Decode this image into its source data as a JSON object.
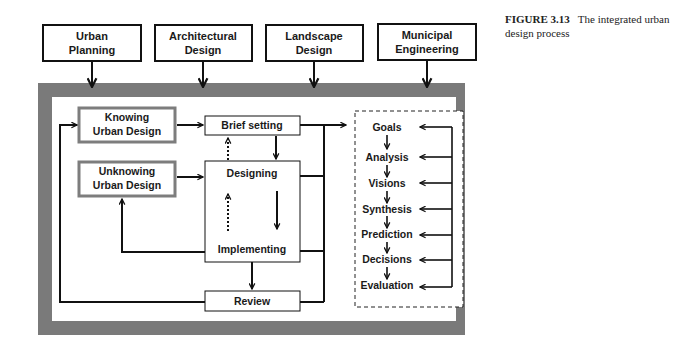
{
  "caption": {
    "figure_label": "FIGURE 3.13",
    "text": "The integrated urban design process"
  },
  "inputs": [
    {
      "line1": "Urban",
      "line2": "Planning"
    },
    {
      "line1": "Architectural",
      "line2": "Design"
    },
    {
      "line1": "Landscape",
      "line2": "Design"
    },
    {
      "line1": "Municipal",
      "line2": "Engineering"
    }
  ],
  "left_boxes": {
    "knowing": {
      "line1": "Knowing",
      "line2": "Urban Design"
    },
    "unknowing": {
      "line1": "Unknowing",
      "line2": "Urban Design"
    }
  },
  "process": {
    "brief": "Brief setting",
    "designing": "Designing",
    "implementing": "Implementing",
    "review": "Review"
  },
  "steps": [
    "Goals",
    "Analysis",
    "Visions",
    "Synthesis",
    "Prediction",
    "Decisions",
    "Evaluation"
  ],
  "colors": {
    "frame": "#7a7a7a",
    "box_border_grey": "#7d7d7d",
    "line": "#111111"
  }
}
